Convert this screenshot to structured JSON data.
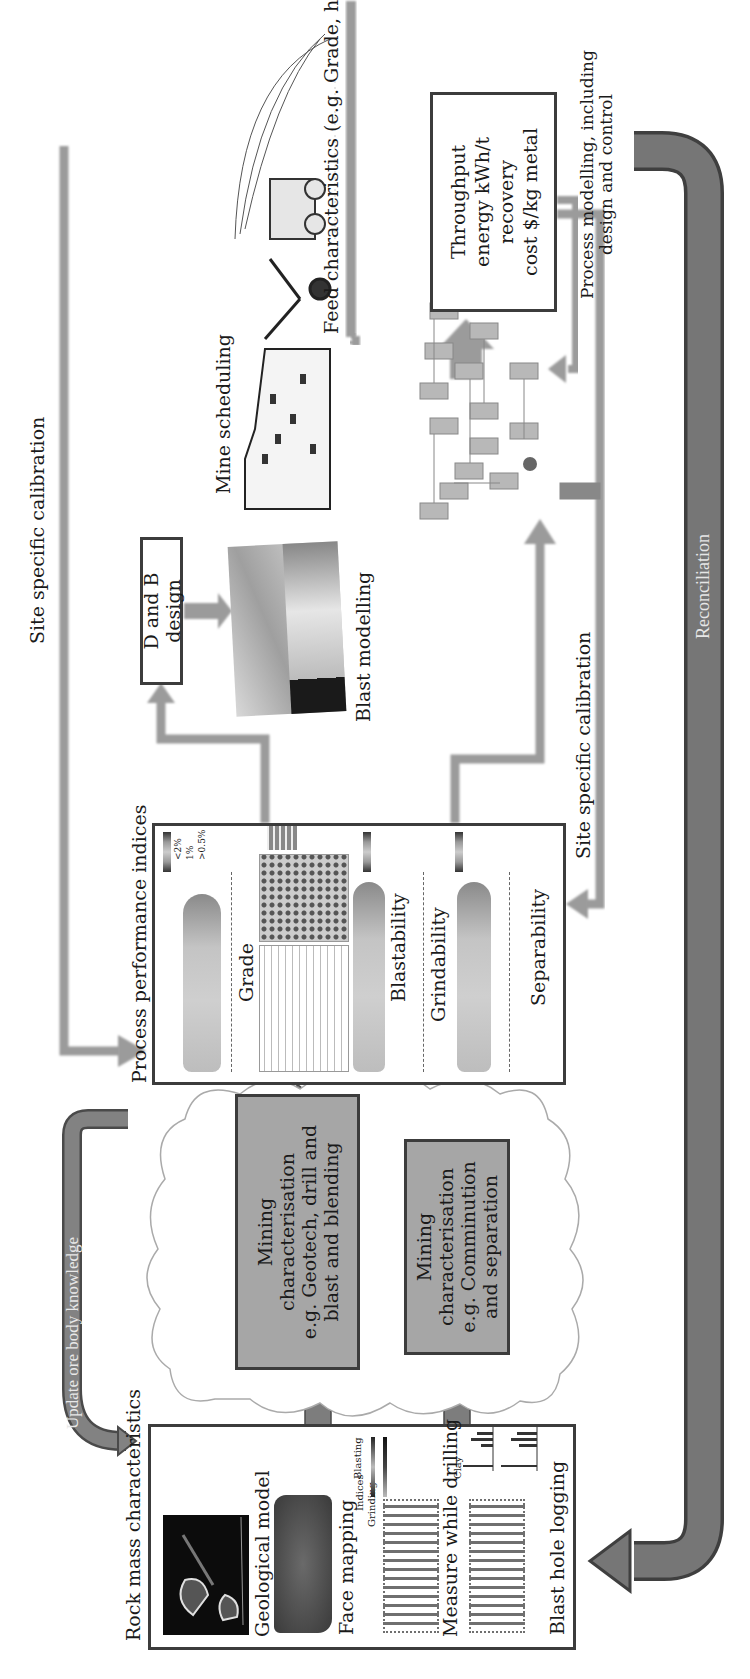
{
  "diagram": {
    "orientation": "rotated -90 degrees",
    "colors": {
      "arrow_light": "#9b9b9b",
      "arrow_dark": "#6e6e6e",
      "box_fill_grey": "#a6a6a6",
      "box_border": "#3c3c3c"
    },
    "rock_mass": {
      "title": "Rock mass characteristics",
      "items": [
        {
          "label": "Geological model"
        },
        {
          "label": "Face mapping",
          "sub": "Indices",
          "sub_labels": [
            "Grinding",
            "Blasting"
          ]
        },
        {
          "label": "Measure while drilling",
          "sub_labels": [
            "Clay",
            "g"
          ]
        },
        {
          "label": "Blast hole logging"
        }
      ]
    },
    "mining_char": [
      {
        "lines": [
          "Mining",
          "characterisation",
          "e.g. Geotech, drill and",
          "blast and blending"
        ]
      },
      {
        "lines": [
          "Mining",
          "characterisation",
          "e.g. Comminution",
          "and separation"
        ]
      }
    ],
    "ppi": {
      "title": "Process performance indices",
      "legend": [
        "<2%",
        "1%",
        ">0.5%"
      ],
      "panels": [
        "Grade",
        "Blastability",
        "Grindability",
        "Separability"
      ]
    },
    "db_design": {
      "label": "D and B design"
    },
    "blast_modelling": {
      "label": "Blast modelling"
    },
    "mine_scheduling": {
      "label": "Mine scheduling"
    },
    "feed_characteristics": {
      "label": "Feed characteristics (e.g. Grade, hardness and size)"
    },
    "throughput": {
      "lines": [
        "Throughput",
        "energy kWh/t",
        "recovery",
        "cost $/kg metal"
      ]
    },
    "process_modelling": {
      "lines": [
        "Process modelling, including",
        "design and control"
      ]
    },
    "flows": {
      "site_calibration_top": "Site specific calibration",
      "site_calibration_bottom": "Site specific calibration",
      "update_ore_body": "Update ore body knowledge",
      "reconciliation": "Reconciliation"
    }
  }
}
